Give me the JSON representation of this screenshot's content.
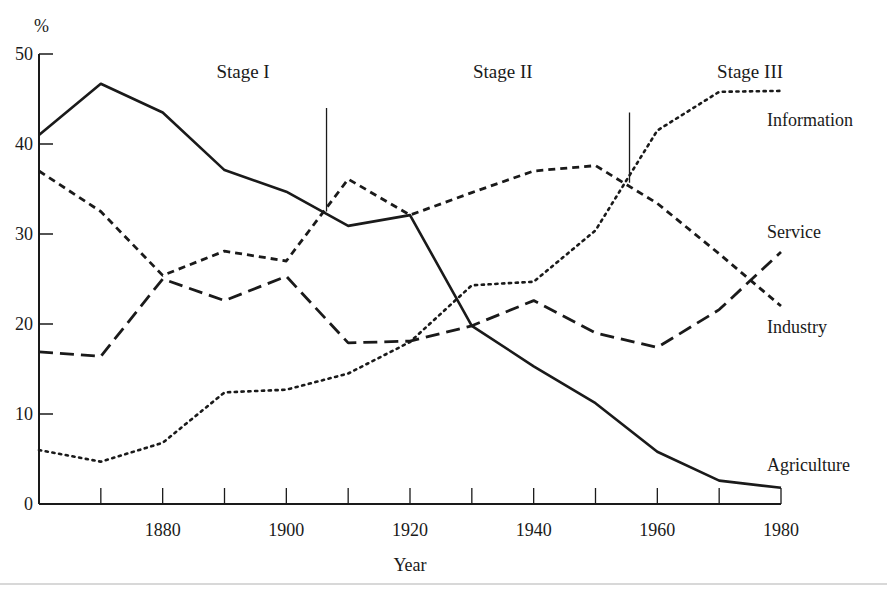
{
  "chart_data": {
    "type": "line",
    "title": "",
    "xlabel": "Year",
    "ylabel": "%",
    "xlim": [
      1860,
      1980
    ],
    "ylim": [
      0,
      50
    ],
    "x_ticks": [
      1860,
      1870,
      1880,
      1890,
      1900,
      1910,
      1920,
      1930,
      1940,
      1950,
      1960,
      1970,
      1980
    ],
    "x_tick_labels": [
      "1880",
      "1900",
      "1920",
      "1940",
      "1960",
      "1980"
    ],
    "x_tick_label_values": [
      1880,
      1900,
      1920,
      1940,
      1960,
      1980
    ],
    "y_ticks": [
      0,
      10,
      20,
      30,
      40,
      50
    ],
    "y_tick_labels": [
      "0",
      "10",
      "20",
      "30",
      "40",
      "50"
    ],
    "grid": false,
    "legend": "inline-right",
    "x": [
      1860,
      1870,
      1880,
      1890,
      1900,
      1910,
      1920,
      1930,
      1940,
      1950,
      1960,
      1970,
      1980
    ],
    "series": [
      {
        "name": "Agriculture",
        "style": "solid",
        "values": [
          41.0,
          46.7,
          43.5,
          37.1,
          34.7,
          30.9,
          32.1,
          19.8,
          15.3,
          11.2,
          5.8,
          2.6,
          1.8
        ]
      },
      {
        "name": "Service",
        "style": "short-dash",
        "values": [
          37.0,
          32.5,
          25.4,
          28.1,
          27.0,
          36.1,
          32.1,
          34.6,
          37.0,
          37.6,
          33.4,
          27.8,
          22.0
        ]
      },
      {
        "name": "Industry",
        "style": "long-dash",
        "values": [
          16.9,
          16.4,
          25.0,
          22.6,
          25.3,
          17.9,
          18.1,
          19.8,
          22.6,
          19.0,
          17.4,
          21.6,
          28.0
        ]
      },
      {
        "name": "Information",
        "style": "dotted",
        "values": [
          6.0,
          4.7,
          6.8,
          12.4,
          12.7,
          14.5,
          18.0,
          24.3,
          24.7,
          30.4,
          41.5,
          45.8,
          45.9
        ]
      }
    ],
    "annotations": {
      "stages": [
        {
          "label": "Stage I",
          "label_x": 1893
        },
        {
          "label": "Stage II",
          "label_x": 1935
        },
        {
          "label": "Stage III",
          "label_x": 1975
        }
      ],
      "stage_markers": [
        {
          "x": 1906.5,
          "y_from": 32.5,
          "y_to": 44.0
        },
        {
          "x": 1955.5,
          "y_from": 35.7,
          "y_to": 43.5
        }
      ]
    }
  },
  "labels": {
    "y_unit": "%",
    "x_title": "Year"
  },
  "colors": {
    "ink": "#1a1a1a",
    "background": "#ffffff"
  }
}
